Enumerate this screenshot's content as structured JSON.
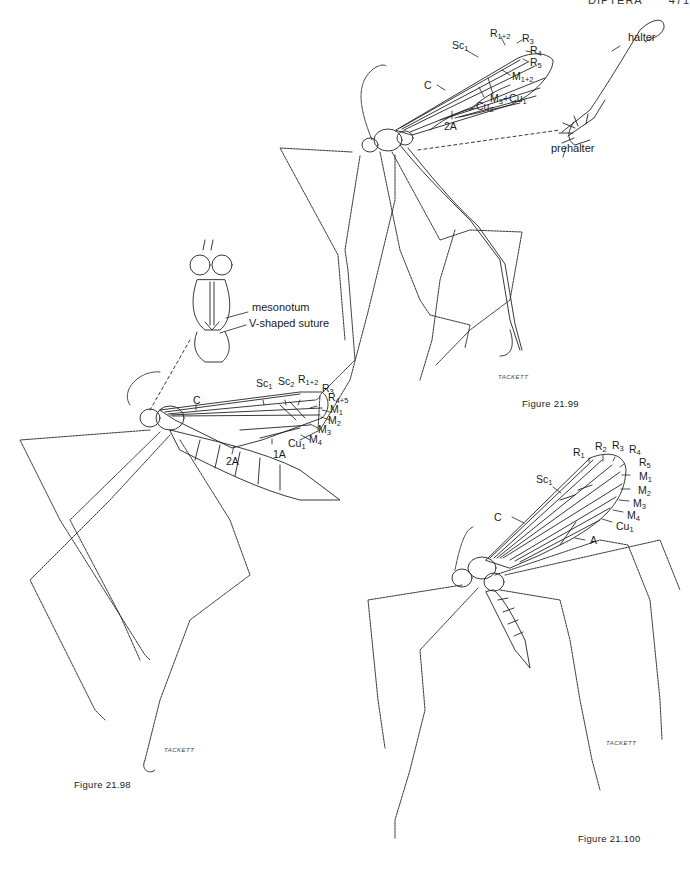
{
  "running_head": {
    "section": "DIPTERA",
    "page": "471"
  },
  "figures": [
    {
      "id": "fig_21_98",
      "caption": "Figure 21.98",
      "signature": "TACKETT",
      "inset_labels": {
        "mesonotum": "mesonotum",
        "suture": "V-shaped suture"
      },
      "wing_labels": [
        {
          "base": "C",
          "sub": ""
        },
        {
          "base": "Sc",
          "sub": "1"
        },
        {
          "base": "Sc",
          "sub": "2"
        },
        {
          "base": "R",
          "sub": "1+2"
        },
        {
          "base": "R",
          "sub": "3"
        },
        {
          "base": "R",
          "sub": "4+5"
        },
        {
          "base": "M",
          "sub": "1"
        },
        {
          "base": "M",
          "sub": "2"
        },
        {
          "base": "M",
          "sub": "3"
        },
        {
          "base": "M",
          "sub": "4"
        },
        {
          "base": "Cu",
          "sub": "1"
        },
        {
          "base": "1A",
          "sub": ""
        },
        {
          "base": "2A",
          "sub": ""
        }
      ]
    },
    {
      "id": "fig_21_99",
      "caption": "Figure 21.99",
      "signature": "TACKETT",
      "inset_labels": {
        "halter": "halter",
        "prehalter": "prehalter"
      },
      "wing_labels": [
        {
          "base": "Sc",
          "sub": "1"
        },
        {
          "base": "R",
          "sub": "1+2"
        },
        {
          "base": "R",
          "sub": "3"
        },
        {
          "base": "R",
          "sub": "4"
        },
        {
          "base": "R",
          "sub": "5"
        },
        {
          "base": "M",
          "sub": "1+2"
        },
        {
          "base": "C",
          "sub": ""
        },
        {
          "base": "M",
          "sub": "3",
          "extra": "+Cu",
          "extra_sub": "1"
        },
        {
          "base": "Cu",
          "sub": "2"
        },
        {
          "base": "2A",
          "sub": ""
        }
      ]
    },
    {
      "id": "fig_21_100",
      "caption": "Figure 21.100",
      "signature": "TACKETT",
      "wing_labels": [
        {
          "base": "R",
          "sub": "1"
        },
        {
          "base": "R",
          "sub": "2"
        },
        {
          "base": "R",
          "sub": "3"
        },
        {
          "base": "R",
          "sub": "4"
        },
        {
          "base": "R",
          "sub": "5"
        },
        {
          "base": "Sc",
          "sub": "1"
        },
        {
          "base": "M",
          "sub": "1"
        },
        {
          "base": "M",
          "sub": "2"
        },
        {
          "base": "M",
          "sub": "3"
        },
        {
          "base": "M",
          "sub": "4"
        },
        {
          "base": "Cu",
          "sub": "1"
        },
        {
          "base": "C",
          "sub": ""
        },
        {
          "base": "A",
          "sub": ""
        }
      ]
    }
  ]
}
